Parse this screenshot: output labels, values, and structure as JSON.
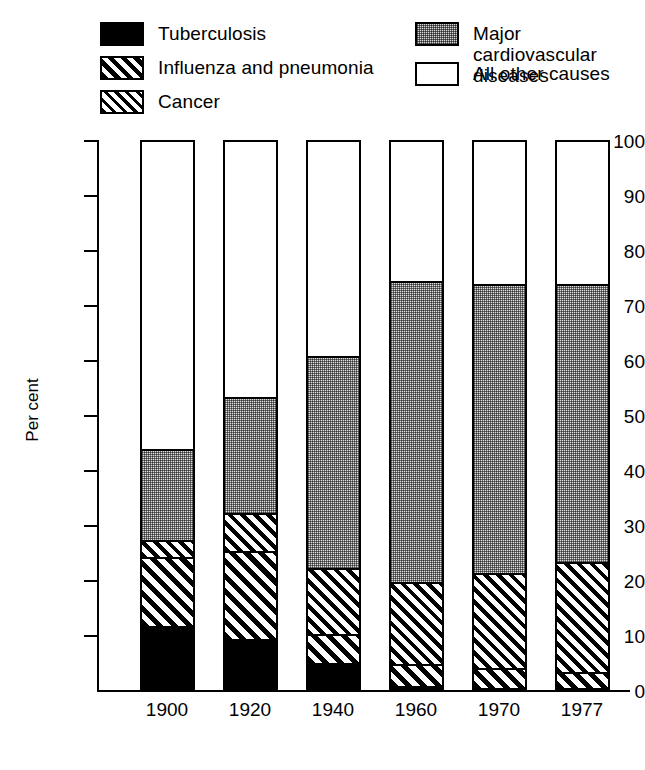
{
  "legend": {
    "left_column": [
      {
        "label": "Tuberculosis",
        "pattern": "solid-black",
        "key": "tuberculosis"
      },
      {
        "label": "Influenza and pneumonia",
        "pattern": "wide-diagonal-hatch",
        "key": "influenza_pneumonia"
      },
      {
        "label": "Cancer",
        "pattern": "narrow-diagonal-hatch",
        "key": "cancer"
      }
    ],
    "right_column": [
      {
        "label": "Major cardiovascular\ndiseases",
        "pattern": "stipple-gray",
        "key": "cardiovascular"
      },
      {
        "label": "All other causes",
        "pattern": "white",
        "key": "all_other"
      }
    ]
  },
  "axes": {
    "y_label": "Per cent",
    "y_ticks": [
      "100",
      "90",
      "80",
      "70",
      "60",
      "50",
      "40",
      "30",
      "20",
      "10",
      "0"
    ],
    "x_ticks": [
      "1900",
      "1920",
      "1940",
      "1960",
      "1970",
      "1977"
    ]
  },
  "colors": {
    "ink": "#000000",
    "stipple_gray": "#dcdcdc",
    "background": "#ffffff"
  },
  "chart_data": {
    "type": "bar",
    "stacked": true,
    "title": "",
    "xlabel": "",
    "ylabel": "Per cent",
    "ylim": [
      0,
      100
    ],
    "yticks": [
      0,
      10,
      20,
      30,
      40,
      50,
      60,
      70,
      80,
      90,
      100
    ],
    "grid": false,
    "legend_position": "top",
    "categories": [
      "1900",
      "1920",
      "1940",
      "1960",
      "1970",
      "1977"
    ],
    "series": [
      {
        "name": "Tuberculosis",
        "pattern": "solid-black",
        "values": [
          11.5,
          9.0,
          4.8,
          0.6,
          0.2,
          0.2
        ]
      },
      {
        "name": "Influenza and pneumonia",
        "pattern": "wide-diagonal-hatch",
        "values": [
          12.5,
          16.0,
          5.2,
          4.0,
          3.6,
          2.8
        ]
      },
      {
        "name": "Cancer",
        "pattern": "narrow-diagonal-hatch",
        "values": [
          3.0,
          7.0,
          12.0,
          14.9,
          17.2,
          20.0
        ]
      },
      {
        "name": "Major cardiovascular diseases",
        "pattern": "stipple-gray",
        "values": [
          16.5,
          21.0,
          38.5,
          54.5,
          52.5,
          50.5
        ]
      },
      {
        "name": "All other causes",
        "pattern": "white",
        "values": [
          56.5,
          47.0,
          39.5,
          26.0,
          26.5,
          26.5
        ]
      }
    ],
    "cumulative_tops": {
      "1900": [
        11.5,
        24.0,
        27.0,
        43.5,
        100
      ],
      "1920": [
        9.0,
        25.0,
        32.0,
        53.0,
        100
      ],
      "1940": [
        4.8,
        10.0,
        22.0,
        60.5,
        100
      ],
      "1960": [
        0.6,
        4.6,
        19.5,
        74.0,
        100
      ],
      "1970": [
        0.2,
        3.8,
        21.0,
        73.5,
        100
      ],
      "1977": [
        0.2,
        3.0,
        23.0,
        73.5,
        100
      ]
    }
  }
}
